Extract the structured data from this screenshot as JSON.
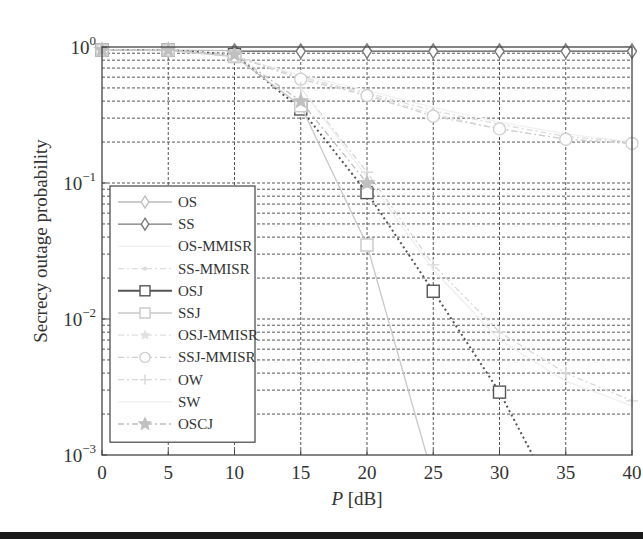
{
  "chart_data": {
    "type": "line",
    "title": "",
    "xlabel": "P [dB]",
    "xlabel_italic_part": "P",
    "xlabel_unit_part": "[dB]",
    "ylabel": "Secrecy outage probability",
    "xlim": [
      0,
      40
    ],
    "ylim": [
      0.001,
      1
    ],
    "yscale": "log",
    "grid": true,
    "legend_position": "lower left",
    "x_ticks": [
      0,
      5,
      10,
      15,
      20,
      25,
      30,
      35,
      40
    ],
    "y_ticks": [
      {
        "value": 1,
        "base": "10",
        "exp": "0"
      },
      {
        "value": 0.1,
        "base": "10",
        "exp": "−1"
      },
      {
        "value": 0.01,
        "base": "10",
        "exp": "−2"
      },
      {
        "value": 0.001,
        "base": "10",
        "exp": "−3"
      }
    ],
    "series": [
      {
        "name": "OS",
        "marker": "diamond",
        "color": "#bdbdbd",
        "dash": "solid",
        "x": [
          0,
          5,
          10,
          15,
          20,
          25,
          30,
          35,
          40
        ],
        "values": [
          0.95,
          0.95,
          0.94,
          0.94,
          0.94,
          0.94,
          0.94,
          0.94,
          0.94
        ]
      },
      {
        "name": "SS",
        "marker": "diamond",
        "color": "#7a7a7a",
        "dash": "solid",
        "x": [
          10,
          15,
          20,
          25,
          30,
          35,
          40
        ],
        "values": [
          0.93,
          0.93,
          0.93,
          0.93,
          0.93,
          0.93,
          0.93
        ]
      },
      {
        "name": "OS-MMISR",
        "marker": "none",
        "color": "#f0f0f0",
        "dash": "solid",
        "x": [
          0,
          5,
          10,
          15,
          20,
          25,
          30,
          35,
          40
        ],
        "values": [
          0.95,
          0.94,
          0.85,
          0.62,
          0.48,
          0.36,
          0.28,
          0.23,
          0.2
        ]
      },
      {
        "name": "SS-MMISR",
        "marker": "dot",
        "color": "#dddddd",
        "dash": "dashdot",
        "x": [
          0,
          5,
          10,
          15,
          20,
          25,
          30,
          35,
          40
        ],
        "values": [
          0.95,
          0.94,
          0.85,
          0.6,
          0.46,
          0.34,
          0.27,
          0.22,
          0.2
        ]
      },
      {
        "name": "OSJ",
        "marker": "square",
        "color": "#555555",
        "dash": "dotted",
        "x": [
          0,
          5,
          10,
          15,
          20,
          25,
          30,
          32.5
        ],
        "values": [
          0.95,
          0.95,
          0.88,
          0.35,
          0.085,
          0.016,
          0.0029,
          0.001
        ]
      },
      {
        "name": "SSJ",
        "marker": "square",
        "color": "#c8c8c8",
        "dash": "solid",
        "x": [
          0,
          5,
          10,
          15,
          20,
          24.5
        ],
        "values": [
          0.95,
          0.95,
          0.85,
          0.37,
          0.035,
          0.001
        ]
      },
      {
        "name": "OSJ-MMISR",
        "marker": "star-small",
        "color": "#e0e0e0",
        "dash": "dashdot",
        "x": [
          0,
          5,
          10,
          15,
          20,
          25,
          30,
          35,
          40
        ],
        "values": [
          0.95,
          0.95,
          0.86,
          0.6,
          0.45,
          0.32,
          0.25,
          0.21,
          0.195
        ]
      },
      {
        "name": "SSJ-MMISR",
        "marker": "circle",
        "color": "#d0d0d0",
        "dash": "dashdot",
        "x": [
          0,
          5,
          10,
          15,
          20,
          25,
          30,
          35,
          40
        ],
        "values": [
          0.95,
          0.95,
          0.86,
          0.58,
          0.44,
          0.31,
          0.25,
          0.21,
          0.195
        ]
      },
      {
        "name": "OW",
        "marker": "plus",
        "color": "#d8d8d8",
        "dash": "dashdot",
        "x": [
          15,
          20,
          25,
          30,
          35,
          40
        ],
        "values": [
          0.5,
          0.12,
          0.025,
          0.008,
          0.004,
          0.0025
        ]
      },
      {
        "name": "SW",
        "marker": "none",
        "color": "#eeeeee",
        "dash": "solid",
        "x": [
          15,
          20,
          25,
          30,
          35,
          40
        ],
        "values": [
          0.5,
          0.11,
          0.023,
          0.007,
          0.0035,
          0.0023
        ]
      },
      {
        "name": "OSCJ",
        "marker": "star",
        "color": "#c0c0c0",
        "dash": "dashdot",
        "x": [
          0,
          5,
          10,
          15,
          20
        ],
        "values": [
          0.95,
          0.95,
          0.88,
          0.4,
          0.1
        ]
      }
    ]
  }
}
